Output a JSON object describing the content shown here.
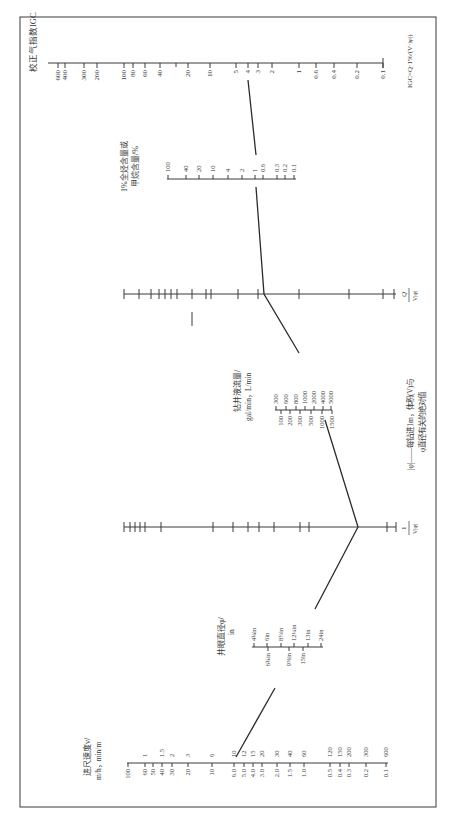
{
  "figure": {
    "orientation": "rotated 90° (text reads bottom-to-top)",
    "formula": "IGC=Q·1%/(V·|φ|)",
    "legend": {
      "line1": "|φ|——每钻进1m，体积(V)与",
      "line2": "φ直径有关的绝对值"
    },
    "scales": {
      "igc": {
        "title": "校正气指数IGC",
        "labels": [
          "600",
          "400",
          "300",
          "200",
          "100",
          "80",
          "60",
          "40",
          "20",
          "10",
          "5",
          "4",
          "3",
          "2",
          "1",
          "0.6",
          "0.4",
          "0.2",
          "0.1"
        ]
      },
      "hydrocarbon": {
        "title_line1": "1%全烃含量或",
        "title_line2": "甲烷含量/%",
        "labels": [
          "100",
          "40",
          "20",
          "10",
          "4",
          "2",
          "1",
          "0.6",
          "0.3",
          "0.2",
          "0.1"
        ]
      },
      "q_axis": {
        "label": "Q/V|φ|",
        "label_num": "Q",
        "label_den": "V|φ|"
      },
      "flow": {
        "title_line1": "钻井液流量/",
        "title_line2": "gal/min，L/min",
        "lpm_labels": [
          "300",
          "600",
          "800",
          "1000",
          "2000",
          "4000",
          "5000"
        ],
        "gpm_labels": [
          "100",
          "200",
          "300",
          "500",
          "1000",
          "1500"
        ]
      },
      "inv_axis": {
        "label": "1/V|φ|",
        "label_num": "1",
        "label_den": "V|φ|"
      },
      "diameter": {
        "title_line1": "井眼直径φ/",
        "title_line2": "in",
        "upper_labels": [
          "4¾in",
          "6in",
          "8½in",
          "12¼in",
          "13in",
          "24in"
        ],
        "lower_labels": [
          "6¾in",
          "9⅞in",
          "15in"
        ]
      },
      "rop": {
        "title_line1": "进尺速度v/",
        "title_line2": "m/h，min/m",
        "mh_labels": [
          "100",
          "60",
          "50",
          "40",
          "30",
          "20",
          "10",
          "6.0",
          "5.0",
          "4.0",
          "3.0",
          "2.0",
          "1.5",
          "1.0",
          "0.5",
          "0.4",
          "0.3",
          "0.2",
          "0.1"
        ],
        "minm_labels": [
          "1",
          "1.5",
          "2",
          "3",
          "6",
          "10",
          "12",
          "15",
          "20",
          "30",
          "40",
          "60",
          "120",
          "150",
          "200",
          "300",
          "600"
        ]
      }
    },
    "example_reading": {
      "rop_mh": "6.0",
      "diameter": "12¼in",
      "flow_lpm": "800",
      "hydrocarbon_pct": "1",
      "igc": "4"
    }
  }
}
